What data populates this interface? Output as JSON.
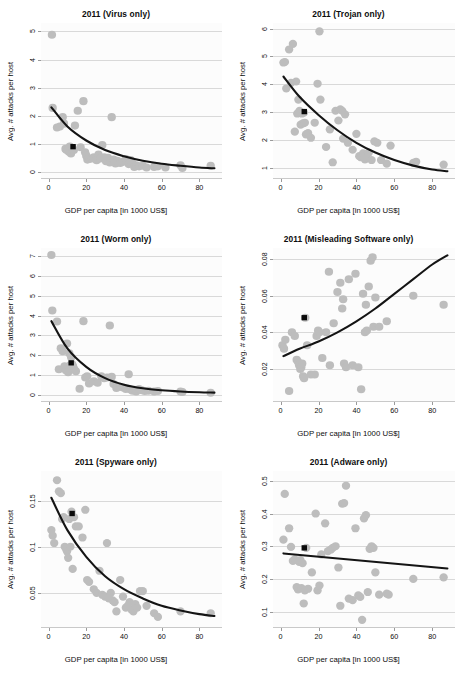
{
  "figure": {
    "rows": 3,
    "cols": 2,
    "shared_xlabel": "GDP per capita [in 1000 US$]",
    "shared_ylabel": "Avg. # attacks per host",
    "point_color": "#bdbdbd",
    "fit_color": "#141414",
    "marker_color": "#0a0a0a",
    "grid_color": "#d9d9d9",
    "panel_bg": "#fcfcfc"
  },
  "chart_data": [
    {
      "type": "scatter",
      "title": "2011 (Virus only)",
      "xlabel": "GDP per capita [in 1000 US$]",
      "ylabel": "Avg. # attacks per host",
      "xlim": [
        -4,
        92
      ],
      "ylim": [
        -0.25,
        5.3
      ],
      "xticks": [
        0,
        20,
        40,
        60,
        80
      ],
      "yticks": [
        0,
        1,
        2,
        3,
        4,
        5
      ],
      "grid": true,
      "legend": "none",
      "series": [
        {
          "name": "countries",
          "x": [
            1.8,
            2.2,
            4.5,
            6.0,
            7.5,
            8.2,
            9.0,
            9.6,
            10.2,
            10.8,
            11.3,
            11.9,
            12.4,
            12.8,
            13.4,
            14.0,
            15.5,
            17.0,
            18.5,
            19.4,
            20.0,
            20.6,
            21.5,
            23.0,
            24.0,
            25.5,
            26.5,
            27.5,
            28.5,
            29.5,
            30.5,
            31.5,
            32.5,
            33.5,
            34.5,
            35.5,
            36.5,
            38.0,
            39.5,
            41.0,
            42.5,
            43.5,
            44.5,
            45.5,
            46.5,
            48.0,
            50.0,
            52.0,
            56.0,
            58.0,
            62.0,
            70.0,
            71.0,
            86.0
          ],
          "y": [
            4.88,
            2.28,
            1.58,
            1.62,
            1.95,
            1.72,
            0.82,
            0.78,
            0.8,
            0.72,
            0.9,
            0.66,
            0.86,
            0.82,
            0.78,
            1.65,
            2.18,
            0.88,
            2.52,
            0.7,
            0.58,
            0.44,
            0.46,
            0.48,
            0.52,
            0.42,
            0.62,
            0.48,
            0.96,
            0.52,
            0.38,
            0.5,
            0.34,
            1.95,
            0.44,
            0.3,
            0.4,
            0.32,
            0.36,
            0.46,
            0.28,
            0.42,
            0.3,
            0.18,
            0.24,
            0.2,
            0.22,
            0.16,
            0.18,
            0.2,
            0.16,
            0.24,
            0.14,
            0.22
          ]
        }
      ],
      "fit": {
        "kind": "exponential-decay",
        "x": [
          1.5,
          10,
          20,
          30,
          40,
          50,
          60,
          70,
          80,
          88
        ],
        "y": [
          2.3,
          1.62,
          1.12,
          0.78,
          0.56,
          0.4,
          0.29,
          0.22,
          0.16,
          0.13
        ]
      },
      "mean_marker": {
        "x": 13.0,
        "y": 0.9,
        "shape": "square"
      }
    },
    {
      "type": "scatter",
      "title": "2011 (Trojan only)",
      "xlabel": "GDP per capita [in 1000 US$]",
      "ylabel": "Avg. # attacks per host",
      "xlim": [
        -4,
        92
      ],
      "ylim": [
        0.6,
        6.2
      ],
      "xticks": [
        0,
        20,
        40,
        60,
        80
      ],
      "yticks": [
        1,
        2,
        3,
        4,
        5,
        6
      ],
      "grid": true,
      "legend": "none",
      "series": [
        {
          "name": "countries",
          "x": [
            1.5,
            2.3,
            3.0,
            4.5,
            5.5,
            6.5,
            7.5,
            8.2,
            8.8,
            9.4,
            10.0,
            10.6,
            11.2,
            11.8,
            12.3,
            12.8,
            13.4,
            14.5,
            16.0,
            18.0,
            19.5,
            20.5,
            21.0,
            24.0,
            26.0,
            27.5,
            29.0,
            30.5,
            31.5,
            32.5,
            33.0,
            34.0,
            35.5,
            38.0,
            40.0,
            41.5,
            42.5,
            43.5,
            44.5,
            45.5,
            46.5,
            48.0,
            49.5,
            51.0,
            53.0,
            56.0,
            58.0,
            70.0,
            71.5,
            86.0
          ],
          "y": [
            4.78,
            4.8,
            3.85,
            5.25,
            4.05,
            5.45,
            2.3,
            4.1,
            2.95,
            3.45,
            3.05,
            2.55,
            2.95,
            2.6,
            2.98,
            2.62,
            2.2,
            2.25,
            2.08,
            2.62,
            4.02,
            5.9,
            3.45,
            1.75,
            2.38,
            1.2,
            3.05,
            2.7,
            3.1,
            3.05,
            2.05,
            2.92,
            1.9,
            1.65,
            2.22,
            1.42,
            1.38,
            1.52,
            1.3,
            1.48,
            1.55,
            1.28,
            1.95,
            1.9,
            1.28,
            1.15,
            1.8,
            1.18,
            1.22,
            1.12
          ]
        }
      ],
      "fit": {
        "kind": "exponential-decay",
        "x": [
          1.5,
          10,
          20,
          30,
          40,
          50,
          60,
          70,
          80,
          88
        ],
        "y": [
          4.28,
          3.55,
          2.9,
          2.35,
          1.9,
          1.55,
          1.28,
          1.08,
          0.94,
          0.88
        ]
      },
      "mean_marker": {
        "x": 12.5,
        "y": 3.02,
        "shape": "square"
      }
    },
    {
      "type": "scatter",
      "title": "2011 (Worm only)",
      "xlabel": "GDP per capita [in 1000 US$]",
      "ylabel": "Avg. # attacks per host",
      "xlim": [
        -4,
        92
      ],
      "ylim": [
        -0.35,
        7.4
      ],
      "xticks": [
        0,
        20,
        40,
        60,
        80
      ],
      "yticks": [
        0,
        1,
        2,
        3,
        4,
        5,
        6,
        7
      ],
      "grid": true,
      "legend": "none",
      "series": [
        {
          "name": "countries",
          "x": [
            1.5,
            2.0,
            4.5,
            5.5,
            6.5,
            7.5,
            8.5,
            9.2,
            9.8,
            10.4,
            11.0,
            11.5,
            12.0,
            12.5,
            13.0,
            13.6,
            14.5,
            16.5,
            18.5,
            19.5,
            20.5,
            21.5,
            24.0,
            26.0,
            28.0,
            29.5,
            31.0,
            32.5,
            33.5,
            34.5,
            36.0,
            38.0,
            39.5,
            41.0,
            42.5,
            43.5,
            44.5,
            45.5,
            46.5,
            48.0,
            49.5,
            51.0,
            53.0,
            56.0,
            58.0,
            70.0,
            71.0,
            86.0
          ],
          "y": [
            7.05,
            4.25,
            3.7,
            1.3,
            2.35,
            2.2,
            1.45,
            1.25,
            2.6,
            1.15,
            2.1,
            1.5,
            1.9,
            1.55,
            1.45,
            1.3,
            1.2,
            0.32,
            3.72,
            0.88,
            0.95,
            0.58,
            0.7,
            0.62,
            0.95,
            0.85,
            0.88,
            3.5,
            0.92,
            0.55,
            0.35,
            0.42,
            0.38,
            0.3,
            1.05,
            0.28,
            0.22,
            0.26,
            0.18,
            0.3,
            0.24,
            0.2,
            0.22,
            0.18,
            0.2,
            0.18,
            0.15,
            0.12
          ]
        }
      ],
      "fit": {
        "kind": "exponential-decay",
        "x": [
          1.5,
          10,
          20,
          30,
          40,
          50,
          60,
          70,
          80,
          88
        ],
        "y": [
          3.72,
          2.35,
          1.42,
          0.85,
          0.52,
          0.34,
          0.24,
          0.18,
          0.14,
          0.12
        ]
      },
      "mean_marker": {
        "x": 12.0,
        "y": 1.62,
        "shape": "square"
      }
    },
    {
      "type": "scatter",
      "title": "2011 (Misleading Software only)",
      "xlabel": "GDP per capita [in 1000 US$]",
      "ylabel": "Avg. # attacks per host",
      "xlim": [
        -4,
        92
      ],
      "ylim": [
        0.002,
        0.086
      ],
      "xticks": [
        0,
        20,
        40,
        60,
        80
      ],
      "yticks": [
        0.02,
        0.04,
        0.06,
        0.08
      ],
      "grid": true,
      "legend": "none",
      "series": [
        {
          "name": "countries",
          "x": [
            1.0,
            1.8,
            2.5,
            4.5,
            6.0,
            7.5,
            8.5,
            9.2,
            9.8,
            10.4,
            10.9,
            11.4,
            11.9,
            12.4,
            13.0,
            14.0,
            16.0,
            18.0,
            19.0,
            19.8,
            20.5,
            22.0,
            24.0,
            25.5,
            26.0,
            28.0,
            30.0,
            31.5,
            32.5,
            33.0,
            33.5,
            34.5,
            36.0,
            38.0,
            39.5,
            41.0,
            42.5,
            43.5,
            44.5,
            45.0,
            45.5,
            46.5,
            47.5,
            48.5,
            49.0,
            50.0,
            52.0,
            56.0,
            70.0,
            86.0
          ],
          "y": [
            0.033,
            0.031,
            0.036,
            0.008,
            0.04,
            0.038,
            0.025,
            0.024,
            0.022,
            0.02,
            0.021,
            0.023,
            0.016,
            0.015,
            0.048,
            0.033,
            0.017,
            0.017,
            0.038,
            0.041,
            0.04,
            0.026,
            0.04,
            0.073,
            0.022,
            0.045,
            0.062,
            0.067,
            0.053,
            0.058,
            0.023,
            0.021,
            0.069,
            0.022,
            0.072,
            0.021,
            0.009,
            0.061,
            0.04,
            0.055,
            0.041,
            0.065,
            0.079,
            0.081,
            0.043,
            0.059,
            0.043,
            0.046,
            0.06,
            0.055
          ]
        }
      ],
      "fit": {
        "kind": "exponential-growth",
        "x": [
          1.5,
          10,
          20,
          30,
          40,
          50,
          60,
          70,
          80,
          88
        ],
        "y": [
          0.027,
          0.031,
          0.035,
          0.04,
          0.046,
          0.053,
          0.061,
          0.069,
          0.077,
          0.082
        ]
      },
      "mean_marker": {
        "x": 12.5,
        "y": 0.048,
        "shape": "square"
      }
    },
    {
      "type": "scatter",
      "title": "2011 (Spyware only)",
      "xlabel": "GDP per capita [in 1000 US$]",
      "ylabel": "Avg. # attacks per host",
      "xlim": [
        -4,
        92
      ],
      "ylim": [
        0.012,
        0.182
      ],
      "xticks": [
        0,
        20,
        40,
        60,
        80
      ],
      "yticks": [
        0.05,
        0.1,
        0.15
      ],
      "grid": true,
      "legend": "none",
      "series": [
        {
          "name": "countries",
          "x": [
            1.5,
            2.2,
            3.0,
            4.5,
            5.5,
            6.5,
            7.2,
            8.0,
            8.6,
            9.2,
            9.8,
            10.4,
            11.0,
            11.6,
            12.2,
            12.8,
            13.5,
            14.5,
            16.0,
            18.0,
            19.5,
            20.5,
            21.5,
            24.0,
            25.5,
            27.0,
            28.5,
            30.0,
            31.0,
            32.0,
            33.0,
            34.0,
            35.0,
            36.0,
            38.0,
            39.5,
            41.0,
            42.0,
            43.0,
            44.0,
            45.0,
            46.0,
            47.0,
            48.5,
            50.0,
            52.0,
            56.0,
            58.0,
            70.0,
            86.0
          ],
          "y": [
            0.118,
            0.112,
            0.104,
            0.172,
            0.16,
            0.158,
            0.13,
            0.132,
            0.1,
            0.098,
            0.095,
            0.088,
            0.13,
            0.1,
            0.138,
            0.076,
            0.132,
            0.122,
            0.122,
            0.11,
            0.14,
            0.064,
            0.062,
            0.054,
            0.05,
            0.074,
            0.048,
            0.046,
            0.104,
            0.044,
            0.05,
            0.042,
            0.04,
            0.03,
            0.064,
            0.046,
            0.034,
            0.036,
            0.04,
            0.032,
            0.03,
            0.038,
            0.034,
            0.052,
            0.052,
            0.036,
            0.028,
            0.024,
            0.03,
            0.028
          ]
        }
      ],
      "fit": {
        "kind": "exponential-decay",
        "x": [
          1.5,
          10,
          20,
          30,
          40,
          50,
          60,
          70,
          80,
          88
        ],
        "y": [
          0.153,
          0.118,
          0.089,
          0.068,
          0.054,
          0.044,
          0.036,
          0.031,
          0.027,
          0.025
        ]
      },
      "mean_marker": {
        "x": 12.5,
        "y": 0.136,
        "shape": "square"
      }
    },
    {
      "type": "scatter",
      "title": "2011 (Adware only)",
      "xlabel": "GDP per capita [in 1000 US$]",
      "ylabel": "Avg. # attacks per host",
      "xlim": [
        -4,
        92
      ],
      "ylim": [
        0.05,
        0.53
      ],
      "xticks": [
        0,
        20,
        40,
        60,
        80
      ],
      "yticks": [
        0.1,
        0.2,
        0.3,
        0.4,
        0.5
      ],
      "grid": true,
      "legend": "none",
      "series": [
        {
          "name": "countries",
          "x": [
            1.5,
            2.2,
            4.5,
            5.5,
            6.5,
            7.5,
            8.5,
            9.2,
            9.8,
            10.4,
            11.0,
            11.6,
            12.2,
            12.8,
            13.5,
            14.5,
            16.5,
            18.5,
            19.5,
            20.5,
            21.5,
            23.5,
            25.0,
            26.5,
            27.5,
            29.0,
            30.5,
            31.5,
            32.5,
            33.5,
            34.5,
            36.0,
            38.0,
            39.5,
            41.0,
            42.0,
            43.0,
            44.0,
            45.0,
            46.0,
            47.0,
            48.0,
            49.0,
            50.0,
            52.0,
            56.0,
            57.0,
            70.0,
            86.0
          ],
          "y": [
            0.32,
            0.46,
            0.355,
            0.298,
            0.255,
            0.26,
            0.175,
            0.168,
            0.252,
            0.258,
            0.172,
            0.248,
            0.125,
            0.165,
            0.295,
            0.17,
            0.22,
            0.4,
            0.165,
            0.18,
            0.275,
            0.37,
            0.285,
            0.29,
            0.295,
            0.3,
            0.235,
            0.118,
            0.43,
            0.432,
            0.485,
            0.14,
            0.135,
            0.355,
            0.15,
            0.145,
            0.075,
            0.385,
            0.395,
            0.16,
            0.292,
            0.3,
            0.295,
            0.22,
            0.152,
            0.155,
            0.152,
            0.2,
            0.205
          ]
        }
      ],
      "fit": {
        "kind": "linear",
        "x": [
          1.5,
          88
        ],
        "y": [
          0.278,
          0.232
        ]
      },
      "mean_marker": {
        "x": 12.5,
        "y": 0.295,
        "shape": "square"
      }
    }
  ]
}
